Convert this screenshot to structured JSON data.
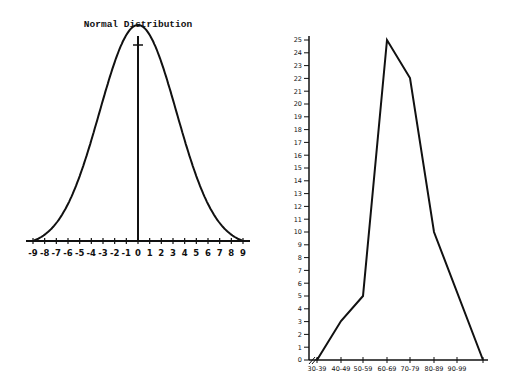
{
  "chart_data": [
    {
      "type": "line",
      "title": "Normal Distribution",
      "xlabel": "",
      "ylabel": "",
      "x_ticks": [
        "-9",
        "-8",
        "-7",
        "-6",
        "-5",
        "-4",
        "-3",
        "-2",
        "-1",
        "0",
        "1",
        "2",
        "3",
        "4",
        "5",
        "6",
        "7",
        "8",
        "9"
      ],
      "xlim": [
        -9,
        9
      ],
      "curve": "bell-shaped normal curve centered at 0",
      "grid": false,
      "legend": null
    },
    {
      "type": "line",
      "title": "",
      "xlabel": "",
      "ylabel": "",
      "categories": [
        "30-39",
        "40-49",
        "50-59",
        "60-69",
        "70-79",
        "80-89",
        "90-99",
        ""
      ],
      "values": [
        0,
        3,
        5,
        25,
        22,
        10,
        null,
        0
      ],
      "polygon_points": [
        {
          "x": "30-39",
          "y": 0
        },
        {
          "x": "40-49",
          "y": 3
        },
        {
          "x": "50-59",
          "y": 5
        },
        {
          "x": "60-69",
          "y": 25
        },
        {
          "x": "70-79",
          "y": 22
        },
        {
          "x": "80-89",
          "y": 10
        },
        {
          "x": "end",
          "y": 0
        }
      ],
      "y_ticks": [
        "0",
        "1",
        "2",
        "3",
        "4",
        "5",
        "6",
        "7",
        "8",
        "9",
        "10",
        "11",
        "12",
        "13",
        "14",
        "15",
        "16",
        "17",
        "18",
        "19",
        "20",
        "21",
        "22",
        "23",
        "24",
        "25"
      ],
      "ylim": [
        0,
        25
      ],
      "axis_break": "//",
      "grid": false,
      "legend": null
    }
  ],
  "left": {
    "title": "Normal Distribution",
    "x_ticks": [
      "-9",
      "-8",
      "-7",
      "-6",
      "-5",
      "-4",
      "-3",
      "-2",
      "-1",
      "0",
      "1",
      "2",
      "3",
      "4",
      "5",
      "6",
      "7",
      "8",
      "9"
    ]
  },
  "right": {
    "x_ticks": [
      "30-39",
      "40-49",
      "50-59",
      "60-69",
      "70-79",
      "80-89",
      "90-99"
    ],
    "y_ticks": [
      "0",
      "1",
      "2",
      "3",
      "4",
      "5",
      "6",
      "7",
      "8",
      "9",
      "10",
      "11",
      "12",
      "13",
      "14",
      "15",
      "16",
      "17",
      "18",
      "19",
      "20",
      "21",
      "22",
      "23",
      "24",
      "25"
    ],
    "axis_break": "//"
  }
}
